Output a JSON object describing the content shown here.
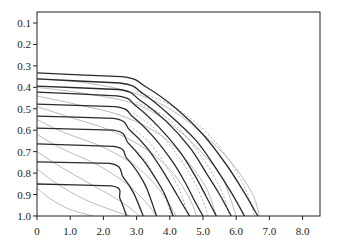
{
  "chart_data": {
    "type": "line",
    "title": "",
    "xlabel": "",
    "ylabel": "",
    "xlim": [
      0,
      8.5
    ],
    "ylim": [
      0.05,
      1.0
    ],
    "y_inverted": true,
    "grid": false,
    "legend": null,
    "x_ticks": [
      0,
      1.0,
      2.0,
      3.0,
      4.0,
      5.0,
      6.0,
      7.0,
      8.0
    ],
    "x_tick_labels": [
      "0",
      "1.0",
      "2.0",
      "3.0",
      "4.0",
      "5.0",
      "6.0",
      "7.0",
      "8.0"
    ],
    "y_ticks": [
      0.1,
      0.2,
      0.3,
      0.4,
      0.5,
      0.6,
      0.7,
      0.8,
      0.9,
      1.0
    ],
    "y_tick_labels": [
      "0.1",
      "0.2",
      "0.3",
      "0.4",
      "0.5",
      "0.6",
      "0.7",
      "0.8",
      "0.9",
      "1.0"
    ],
    "series": [
      {
        "name": "dark-1",
        "style": "solid-dark",
        "points": [
          [
            0,
            0.333
          ],
          [
            2.55,
            0.35
          ],
          [
            3.3,
            0.4
          ],
          [
            4.2,
            0.5
          ],
          [
            5.0,
            0.62
          ],
          [
            5.7,
            0.76
          ],
          [
            6.2,
            0.88
          ],
          [
            6.65,
            1.0
          ]
        ]
      },
      {
        "name": "dark-2",
        "style": "solid-dark",
        "points": [
          [
            0,
            0.361
          ],
          [
            2.5,
            0.38
          ],
          [
            3.2,
            0.43
          ],
          [
            4.0,
            0.53
          ],
          [
            4.8,
            0.65
          ],
          [
            5.4,
            0.78
          ],
          [
            5.85,
            0.89
          ],
          [
            6.25,
            1.0
          ]
        ]
      },
      {
        "name": "dark-3",
        "style": "solid-dark",
        "points": [
          [
            0,
            0.394
          ],
          [
            2.45,
            0.41
          ],
          [
            3.1,
            0.46
          ],
          [
            3.9,
            0.56
          ],
          [
            4.6,
            0.68
          ],
          [
            5.1,
            0.8
          ],
          [
            5.5,
            0.9
          ],
          [
            5.85,
            1.0
          ]
        ]
      },
      {
        "name": "dark-4",
        "style": "solid-dark",
        "points": [
          [
            0,
            0.422
          ],
          [
            2.4,
            0.44
          ],
          [
            3.0,
            0.49
          ],
          [
            3.7,
            0.59
          ],
          [
            4.3,
            0.7
          ],
          [
            4.75,
            0.81
          ],
          [
            5.1,
            0.91
          ],
          [
            5.4,
            1.0
          ]
        ]
      },
      {
        "name": "dark-5",
        "style": "solid-dark",
        "points": [
          [
            0,
            0.478
          ],
          [
            2.35,
            0.49
          ],
          [
            2.9,
            0.54
          ],
          [
            3.5,
            0.63
          ],
          [
            4.05,
            0.74
          ],
          [
            4.45,
            0.84
          ],
          [
            4.75,
            0.93
          ],
          [
            5.0,
            1.0
          ]
        ]
      },
      {
        "name": "dark-6",
        "style": "solid-dark",
        "points": [
          [
            0,
            0.534
          ],
          [
            2.3,
            0.545
          ],
          [
            2.8,
            0.6
          ],
          [
            3.3,
            0.68
          ],
          [
            3.75,
            0.78
          ],
          [
            4.1,
            0.87
          ],
          [
            4.4,
            0.95
          ],
          [
            4.6,
            1.0
          ]
        ]
      },
      {
        "name": "dark-7",
        "style": "solid-dark",
        "points": [
          [
            0,
            0.59
          ],
          [
            2.3,
            0.6
          ],
          [
            2.75,
            0.66
          ],
          [
            3.2,
            0.74
          ],
          [
            3.55,
            0.82
          ],
          [
            3.85,
            0.9
          ],
          [
            4.1,
            1.0
          ]
        ]
      },
      {
        "name": "dark-8",
        "style": "solid-dark",
        "points": [
          [
            0,
            0.664
          ],
          [
            2.3,
            0.675
          ],
          [
            2.7,
            0.73
          ],
          [
            3.05,
            0.8
          ],
          [
            3.3,
            0.87
          ],
          [
            3.6,
            1.0
          ]
        ]
      },
      {
        "name": "dark-9",
        "style": "solid-dark",
        "points": [
          [
            0,
            0.748
          ],
          [
            2.2,
            0.755
          ],
          [
            2.6,
            0.82
          ],
          [
            2.9,
            0.89
          ],
          [
            3.2,
            1.0
          ]
        ]
      },
      {
        "name": "dark-10",
        "style": "solid-dark",
        "points": [
          [
            0,
            0.851
          ],
          [
            2.25,
            0.86
          ],
          [
            2.5,
            0.92
          ],
          [
            2.7,
            1.0
          ]
        ]
      },
      {
        "name": "gray-1",
        "style": "solid-gray",
        "points": [
          [
            0,
            0.36
          ],
          [
            1.5,
            0.38
          ],
          [
            3.0,
            0.43
          ],
          [
            4.2,
            0.52
          ],
          [
            5.3,
            0.66
          ],
          [
            6.0,
            0.78
          ],
          [
            6.5,
            0.9
          ],
          [
            6.7,
            1.0
          ]
        ]
      },
      {
        "name": "gray-2",
        "style": "solid-gray",
        "points": [
          [
            0,
            0.4
          ],
          [
            1.5,
            0.43
          ],
          [
            3.0,
            0.48
          ],
          [
            4.1,
            0.58
          ],
          [
            5.0,
            0.71
          ],
          [
            5.6,
            0.83
          ],
          [
            6.0,
            1.0
          ]
        ]
      },
      {
        "name": "gray-3",
        "style": "solid-gray",
        "points": [
          [
            0,
            0.44
          ],
          [
            1.2,
            0.48
          ],
          [
            2.5,
            0.53
          ],
          [
            3.7,
            0.62
          ],
          [
            4.5,
            0.74
          ],
          [
            5.1,
            0.87
          ],
          [
            5.4,
            1.0
          ]
        ]
      },
      {
        "name": "gray-4",
        "style": "solid-gray",
        "points": [
          [
            0,
            0.49
          ],
          [
            1.0,
            0.54
          ],
          [
            2.2,
            0.6
          ],
          [
            3.3,
            0.69
          ],
          [
            4.1,
            0.8
          ],
          [
            4.6,
            0.92
          ],
          [
            4.8,
            1.0
          ]
        ]
      },
      {
        "name": "gray-5",
        "style": "solid-gray",
        "points": [
          [
            0,
            0.55
          ],
          [
            0.8,
            0.61
          ],
          [
            2.0,
            0.68
          ],
          [
            3.0,
            0.77
          ],
          [
            3.7,
            0.88
          ],
          [
            4.2,
            1.0
          ]
        ]
      },
      {
        "name": "gray-6",
        "style": "solid-gray",
        "points": [
          [
            0,
            0.62
          ],
          [
            0.8,
            0.69
          ],
          [
            1.8,
            0.76
          ],
          [
            2.7,
            0.85
          ],
          [
            3.3,
            0.94
          ],
          [
            3.6,
            1.0
          ]
        ]
      },
      {
        "name": "gray-7",
        "style": "solid-gray",
        "points": [
          [
            0,
            0.7
          ],
          [
            0.7,
            0.77
          ],
          [
            1.6,
            0.85
          ],
          [
            2.5,
            0.93
          ],
          [
            3.1,
            1.0
          ]
        ]
      },
      {
        "name": "gray-8",
        "style": "solid-gray",
        "points": [
          [
            0,
            0.78
          ],
          [
            0.6,
            0.85
          ],
          [
            1.4,
            0.92
          ],
          [
            2.2,
            0.97
          ],
          [
            2.8,
            1.0
          ]
        ]
      },
      {
        "name": "gray-9",
        "style": "solid-gray",
        "points": [
          [
            0,
            0.87
          ],
          [
            0.4,
            0.92
          ],
          [
            1.0,
            0.97
          ],
          [
            1.7,
            1.0
          ]
        ]
      },
      {
        "name": "dash-1",
        "style": "dashed-gray",
        "points": [
          [
            3.0,
            0.42
          ],
          [
            4.0,
            0.48
          ],
          [
            4.9,
            0.58
          ],
          [
            5.6,
            0.7
          ],
          [
            6.1,
            0.82
          ],
          [
            6.4,
            0.92
          ],
          [
            6.55,
            1.0
          ]
        ]
      },
      {
        "name": "dash-2",
        "style": "dashed-gray",
        "points": [
          [
            3.0,
            0.47
          ],
          [
            3.9,
            0.54
          ],
          [
            4.6,
            0.65
          ],
          [
            5.2,
            0.78
          ],
          [
            5.6,
            0.9
          ],
          [
            5.8,
            1.0
          ]
        ]
      },
      {
        "name": "dash-3",
        "style": "dashed-gray",
        "points": [
          [
            2.9,
            0.52
          ],
          [
            3.6,
            0.6
          ],
          [
            4.2,
            0.71
          ],
          [
            4.7,
            0.83
          ],
          [
            5.0,
            0.93
          ],
          [
            5.15,
            1.0
          ]
        ]
      },
      {
        "name": "dash-4",
        "style": "dashed-gray",
        "points": [
          [
            2.8,
            0.58
          ],
          [
            3.4,
            0.66
          ],
          [
            3.9,
            0.77
          ],
          [
            4.3,
            0.88
          ],
          [
            4.55,
            1.0
          ]
        ]
      },
      {
        "name": "dash-5",
        "style": "dashed-gray",
        "points": [
          [
            2.7,
            0.65
          ],
          [
            3.2,
            0.73
          ],
          [
            3.6,
            0.83
          ],
          [
            3.9,
            0.93
          ],
          [
            4.05,
            1.0
          ]
        ]
      }
    ]
  },
  "colors": {
    "axis": "#222222",
    "dark_line": "#2a2a2a",
    "gray_line": "#a8a8a8",
    "dashed_line": "#9a9a9a"
  }
}
